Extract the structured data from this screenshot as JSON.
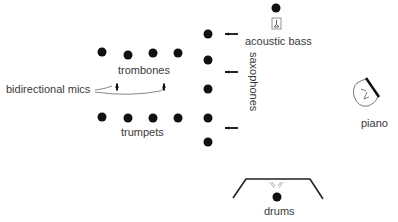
{
  "diagram": {
    "type": "stage-layout",
    "labels": {
      "trombones": "trombones",
      "trumpets": "trumpets",
      "saxophones": "saxophones",
      "acoustic_bass": "acoustic bass",
      "piano": "piano",
      "drums": "drums",
      "bidirectional_mics": "bidirectional mics"
    },
    "colors": {
      "ink": "#111111",
      "text": "#3a3a3a",
      "outline": "#555555"
    },
    "sections": {
      "trombones": {
        "dots": [
          [
            102,
            52
          ],
          [
            128,
            55
          ],
          [
            153,
            53
          ],
          [
            178,
            53
          ]
        ]
      },
      "trumpets": {
        "dots": [
          [
            102,
            117
          ],
          [
            128,
            118
          ],
          [
            153,
            118
          ],
          [
            178,
            118
          ]
        ]
      },
      "saxophones": {
        "dots": [
          [
            208,
            34
          ],
          [
            208,
            60
          ],
          [
            208,
            89
          ],
          [
            208,
            118
          ],
          [
            208,
            142
          ]
        ],
        "mic_arrows": [
          [
            225,
            34,
            238,
            34
          ],
          [
            225,
            72,
            238,
            72
          ],
          [
            225,
            128,
            238,
            128
          ]
        ]
      },
      "acoustic_bass": {
        "dot": [
          276,
          8
        ],
        "icon_box": [
          272,
          18,
          9,
          11
        ]
      },
      "drums": {
        "dot": [
          277,
          197
        ]
      }
    },
    "mics": {
      "bidirectional": [
        [
          117,
          87
        ],
        [
          164,
          87
        ]
      ]
    }
  }
}
